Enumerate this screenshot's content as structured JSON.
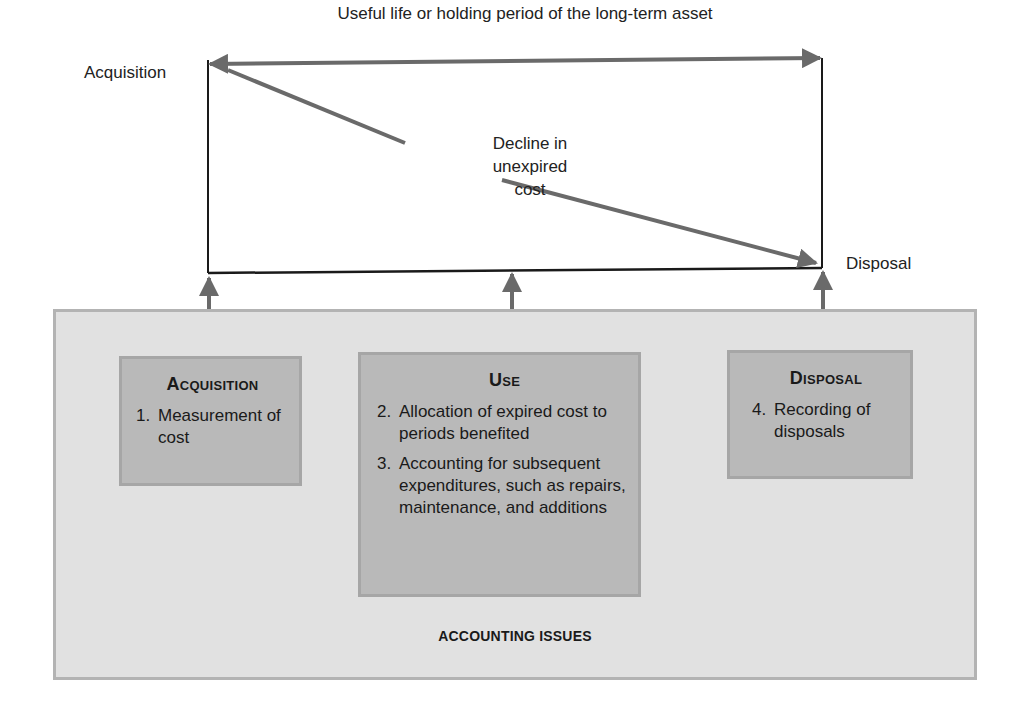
{
  "diagram": {
    "timeline": {
      "caption": "Useful life or holding period of the long-term asset",
      "start_label": "Acquisition",
      "end_label": "Disposal",
      "decline_label_lines": [
        "Decline in",
        "unexpired",
        "cost"
      ]
    },
    "panel": {
      "title": "ACCOUNTING ISSUES",
      "boxes": [
        {
          "title": "Acquisition",
          "items": [
            {
              "num": "1.",
              "text": "Measurement of cost"
            }
          ]
        },
        {
          "title": "Use",
          "items": [
            {
              "num": "2.",
              "text": "Allocation of expired cost to periods benefited"
            },
            {
              "num": "3.",
              "text": "Accounting for subsequent expenditures, such as repairs, maintenance, and additions"
            }
          ]
        },
        {
          "title": "Disposal",
          "items": [
            {
              "num": "4.",
              "text": "Recording of disposals"
            }
          ]
        }
      ]
    },
    "colors": {
      "arrow": "#6a6a6a",
      "rectangle_border": "#1a1a1a",
      "panel_fill": "#e1e1e1",
      "panel_border": "#b3b3b3",
      "box_fill": "#b9b9b9",
      "box_border": "#a6a6a6"
    }
  }
}
